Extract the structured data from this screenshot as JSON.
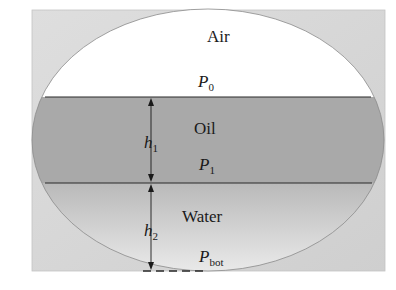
{
  "diagram": {
    "layers": {
      "air": {
        "label": "Air",
        "pressure_symbol": "P",
        "pressure_subscript": "0",
        "color": "#ffffff"
      },
      "oil": {
        "label": "Oil",
        "pressure_symbol": "P",
        "pressure_subscript": "1",
        "color": "#a8a8a8"
      },
      "water": {
        "label": "Water",
        "pressure_symbol": "P",
        "pressure_subscript": "bot",
        "color_top": "#b8b8b8",
        "color_bottom": "#ececec"
      }
    },
    "heights": {
      "h1": {
        "symbol": "h",
        "subscript": "1"
      },
      "h2": {
        "symbol": "h",
        "subscript": "2"
      }
    },
    "frame_color": "#d6d6d6",
    "line_color": "#2a2a2a"
  }
}
